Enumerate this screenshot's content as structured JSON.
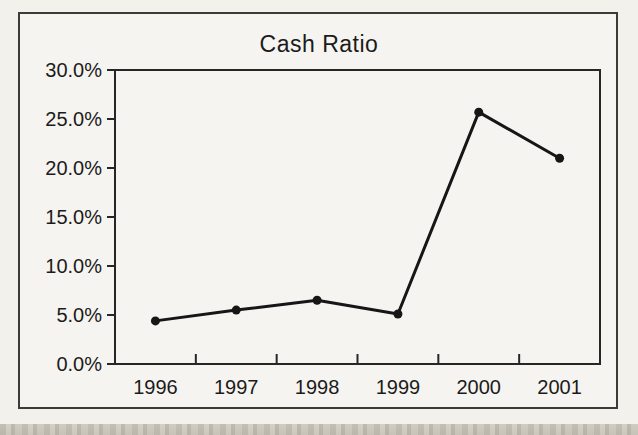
{
  "figure": {
    "title": "Cash Ratio",
    "paper_color": "#f3f1ec",
    "frame_border_color": "#3b3b39",
    "axis_color": "#262624",
    "line_color": "#161616",
    "text_color": "#1b1b1b"
  },
  "chart_data": {
    "type": "line",
    "title": "Cash Ratio",
    "categories": [
      "1996",
      "1997",
      "1998",
      "1999",
      "2000",
      "2001"
    ],
    "series": [
      {
        "name": "Cash Ratio",
        "values": [
          4.4,
          5.5,
          6.5,
          5.1,
          25.7,
          21.0
        ]
      }
    ],
    "xlabel": "",
    "ylabel": "",
    "ylim": [
      0,
      30
    ],
    "y_tick_values": [
      0,
      5,
      10,
      15,
      20,
      25,
      30
    ],
    "y_tick_labels": [
      "0.0%",
      "5.0%",
      "10.0%",
      "15.0%",
      "20.0%",
      "25.0%",
      "30.0%"
    ],
    "grid": false,
    "legend_position": "none",
    "marker": "circle"
  }
}
